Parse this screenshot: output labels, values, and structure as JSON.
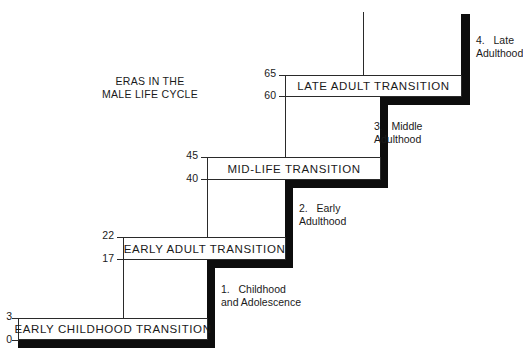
{
  "title": {
    "line1": "ERAS IN THE",
    "line2": "MALE LIFE CYCLE"
  },
  "transitions": [
    {
      "label": "EARLY CHILDHOOD TRANSITION",
      "start_age": "0",
      "end_age": "3"
    },
    {
      "label": "EARLY ADULT TRANSITION",
      "start_age": "17",
      "end_age": "22"
    },
    {
      "label": "MID-LIFE TRANSITION",
      "start_age": "40",
      "end_age": "45"
    },
    {
      "label": "LATE ADULT TRANSITION",
      "start_age": "60",
      "end_age": "65"
    }
  ],
  "eras": [
    {
      "number": "1.",
      "line1": "Childhood",
      "line2": "and Adolescence"
    },
    {
      "number": "2.",
      "line1": "Early",
      "line2": "Adulthood"
    },
    {
      "number": "3.",
      "line1": "Middle",
      "line2": "Adulthood"
    },
    {
      "number": "4.",
      "line1": "Late",
      "line2": "Adulthood"
    }
  ],
  "colors": {
    "stair": "#0d0d0d",
    "line": "#2a2a2a",
    "background": "#ffffff"
  }
}
